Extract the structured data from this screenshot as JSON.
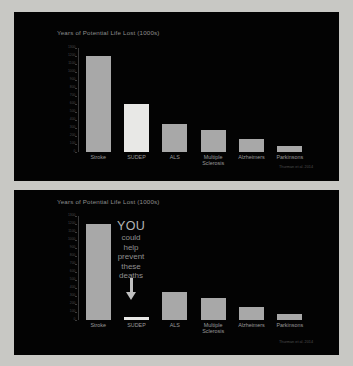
{
  "slides": [
    {
      "name": "slide-with-asterisk",
      "title": "Years of Potential Life Lost (1000s)",
      "citation": "Thurman et al. 2014",
      "annotation": "*"
    },
    {
      "name": "slide-with-call-to-action",
      "title": "Years of Potential Life Lost (1000s)",
      "citation": "Thurman et al. 2014",
      "overlay": {
        "headline": "YOU",
        "lines": [
          "could",
          "help",
          "prevent",
          "these",
          "deaths"
        ],
        "arrow_icon": "down-arrow-icon"
      }
    }
  ],
  "chart_data": {
    "type": "bar",
    "title": "Years of Potential Life Lost (1000s)",
    "xlabel": "",
    "ylabel": "Years of Potential Life Lost (1000s)",
    "categories": [
      "Stroke",
      "SUDEP",
      "ALS",
      "Multiple Sclerosis",
      "Alzheimers",
      "Parkinsons"
    ],
    "values": [
      1200,
      600,
      350,
      280,
      160,
      80
    ],
    "ylim": [
      0,
      1300
    ],
    "yticks": [
      0,
      100,
      200,
      300,
      400,
      500,
      600,
      700,
      800,
      900,
      1000,
      1100,
      1200,
      1300
    ],
    "ytick_labels": [
      "0",
      "100",
      "200",
      "300",
      "400",
      "500",
      "600",
      "700",
      "800",
      "900",
      "1000",
      "1100",
      "1200",
      "1300"
    ],
    "grid": false,
    "legend": false,
    "highlight_category": "SUDEP",
    "colors": {
      "background": "#030303",
      "bar": "#a8a8a8",
      "bar_highlight": "#e8e8e6",
      "text": "#9a9a9a",
      "axis": "#3a3a3a"
    },
    "source": "Thurman et al. 2014"
  }
}
